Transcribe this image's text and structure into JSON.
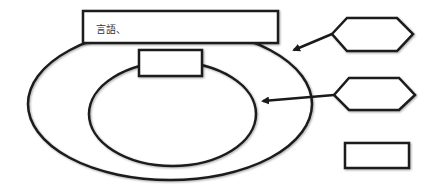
{
  "diagram": {
    "top_box": {
      "label": "言語、"
    },
    "inner_box": {
      "label": ""
    },
    "hexagon_1": {
      "label": ""
    },
    "hexagon_2": {
      "label": ""
    },
    "bottom_box": {
      "label": ""
    }
  },
  "colors": {
    "stroke": "#1a1a1a",
    "fill": "#ffffff",
    "text": "#333333"
  }
}
